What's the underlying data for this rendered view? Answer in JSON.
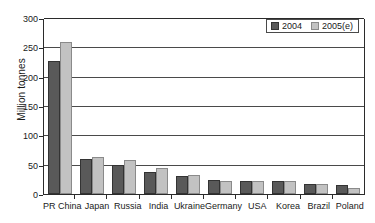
{
  "chart_data": {
    "type": "bar",
    "title": "",
    "xlabel": "",
    "ylabel": "Million tonnes",
    "ylim": [
      0,
      300
    ],
    "yticks": [
      0,
      50,
      100,
      150,
      200,
      250,
      300
    ],
    "grid": true,
    "legend_position": "top-right",
    "categories": [
      "PR China",
      "Japan",
      "Russia",
      "India",
      "Ukraine",
      "Germany",
      "USA",
      "Korea",
      "Brazil",
      "Poland"
    ],
    "series": [
      {
        "name": "2004",
        "color": "#595959",
        "values": [
          227,
          60,
          49,
          37,
          31,
          24,
          23,
          23,
          17,
          16
        ]
      },
      {
        "name": "2005(e)",
        "color": "#c2c2c2",
        "values": [
          259,
          63,
          58,
          44,
          33,
          23,
          22,
          23,
          17,
          11
        ]
      }
    ]
  },
  "legend": {
    "items": [
      {
        "label": "2004"
      },
      {
        "label": "2005(e)"
      }
    ]
  },
  "axis": {
    "y_title": "Million tonnes",
    "y_tick_labels": [
      "300",
      "250",
      "200",
      "150",
      "100",
      "50",
      "0"
    ]
  }
}
